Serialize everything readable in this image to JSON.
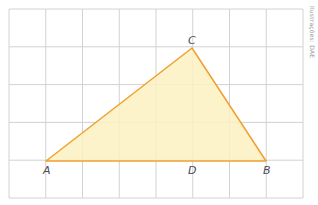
{
  "diagram": {
    "type": "geometry-grid-triangle",
    "grid": {
      "x0": 9,
      "y0": 9,
      "x1": 303,
      "y1": 198,
      "cols": 8,
      "rows": 5,
      "line_color": "#d2d2d2"
    },
    "triangle": {
      "fill": "#fdf1c2",
      "stroke": "#f0a030",
      "vertices": {
        "A": [
          46,
          161
        ],
        "B": [
          266,
          161
        ],
        "C": [
          192,
          48
        ]
      }
    },
    "segment_CD": {
      "from": [
        192,
        48
      ],
      "to": [
        192,
        161
      ]
    },
    "labels": {
      "A": {
        "text": "A",
        "x": 43,
        "y": 174
      },
      "B": {
        "text": "B",
        "x": 263,
        "y": 174
      },
      "C": {
        "text": "C",
        "x": 188,
        "y": 44
      },
      "D": {
        "text": "D",
        "x": 188,
        "y": 174
      }
    },
    "credit": "Ilustrações: DAE"
  }
}
